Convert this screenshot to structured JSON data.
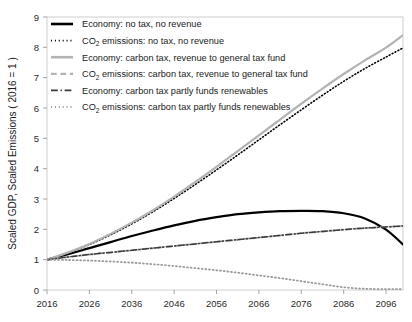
{
  "chart_data": {
    "type": "line",
    "title": "",
    "xlabel": "",
    "ylabel": "Scaled GDP, Scaled Emissions ( 2016 = 1 )",
    "xlim": [
      2016,
      2100
    ],
    "ylim": [
      0,
      9
    ],
    "yticks": [
      0,
      1,
      2,
      3,
      4,
      5,
      6,
      7,
      8,
      9
    ],
    "xticks": [
      2016,
      2026,
      2036,
      2046,
      2056,
      2066,
      2076,
      2086,
      2096
    ],
    "grid": false,
    "legend_position": "upper-left-inside",
    "x": [
      2016,
      2021,
      2026,
      2031,
      2036,
      2041,
      2046,
      2051,
      2056,
      2061,
      2066,
      2071,
      2076,
      2081,
      2086,
      2091,
      2096,
      2100
    ],
    "series": [
      {
        "name": "Economy: no tax, no revenue",
        "color": "#000000",
        "style": "solid",
        "width": 2.2,
        "values": [
          1.0,
          1.18,
          1.38,
          1.58,
          1.78,
          1.96,
          2.13,
          2.28,
          2.4,
          2.5,
          2.56,
          2.6,
          2.61,
          2.6,
          2.53,
          2.36,
          1.99,
          1.5
        ]
      },
      {
        "name": "CO2 emissions: no tax, no revenue",
        "color": "#000000",
        "style": "dotted",
        "width": 1.6,
        "values": [
          1.0,
          1.23,
          1.5,
          1.82,
          2.18,
          2.58,
          3.02,
          3.48,
          3.96,
          4.45,
          4.95,
          5.45,
          5.94,
          6.42,
          6.88,
          7.3,
          7.68,
          7.98
        ]
      },
      {
        "name": "Economy: carbon tax, revenue to general tax fund",
        "color": "#b3b3b3",
        "style": "solid",
        "width": 2.2,
        "values": [
          1.0,
          1.24,
          1.52,
          1.85,
          2.22,
          2.63,
          3.08,
          3.56,
          4.06,
          4.58,
          5.1,
          5.62,
          6.14,
          6.64,
          7.12,
          7.57,
          7.99,
          8.4
        ]
      },
      {
        "name": "CO2 emissions: carbon tax, revenue to general tax fund",
        "color": "#b3b3b3",
        "style": "dashed",
        "width": 2.0,
        "values": [
          1.0,
          1.09,
          1.17,
          1.24,
          1.31,
          1.38,
          1.45,
          1.52,
          1.59,
          1.66,
          1.73,
          1.8,
          1.87,
          1.93,
          1.99,
          2.04,
          2.08,
          2.11
        ]
      },
      {
        "name": "Economy: carbon tax partly funds renewables",
        "color": "#3a3a3a",
        "style": "dashdot",
        "width": 1.5,
        "values": [
          1.0,
          1.09,
          1.17,
          1.24,
          1.31,
          1.38,
          1.45,
          1.52,
          1.59,
          1.66,
          1.73,
          1.8,
          1.87,
          1.93,
          1.99,
          2.04,
          2.08,
          2.11
        ]
      },
      {
        "name": "CO2 emissions: carbon tax partly funds renewables",
        "color": "#9a9a9a",
        "style": "dotted",
        "width": 1.8,
        "values": [
          1.0,
          0.99,
          0.97,
          0.94,
          0.9,
          0.85,
          0.79,
          0.72,
          0.65,
          0.57,
          0.48,
          0.39,
          0.29,
          0.19,
          0.09,
          0.04,
          0.03,
          0.03
        ]
      }
    ]
  },
  "legend": {
    "items": [
      {
        "prefix": "Economy: no tax, no revenue",
        "sub": "",
        "suffix": "",
        "swatch": "solid-black"
      },
      {
        "prefix": "CO",
        "sub": "2",
        "suffix": " emissions: no tax, no revenue",
        "swatch": "dotted-black"
      },
      {
        "prefix": "Economy: carbon tax, revenue to general tax fund",
        "sub": "",
        "suffix": "",
        "swatch": "solid-gray"
      },
      {
        "prefix": "CO",
        "sub": "2",
        "suffix": " emissions: carbon tax, revenue to general tax fund",
        "swatch": "dashed-gray"
      },
      {
        "prefix": "Economy: carbon tax partly funds renewables",
        "sub": "",
        "suffix": "",
        "swatch": "dashdot-dark"
      },
      {
        "prefix": "CO",
        "sub": "2",
        "suffix": " emissions: carbon tax partly funds renewables",
        "swatch": "dotted-gray"
      }
    ]
  },
  "axes": {
    "y_title": "Scaled GDP, Scaled Emissions ( 2016 = 1 )",
    "y_ticks": [
      "0",
      "1",
      "2",
      "3",
      "4",
      "5",
      "6",
      "7",
      "8",
      "9"
    ],
    "x_ticks": [
      "2016",
      "2026",
      "2036",
      "2046",
      "2056",
      "2066",
      "2076",
      "2086",
      "2096"
    ]
  }
}
